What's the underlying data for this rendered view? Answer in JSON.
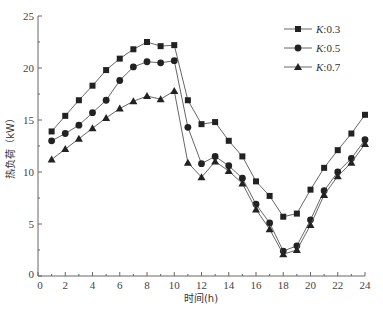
{
  "chart_data": {
    "type": "line",
    "title": "",
    "xlabel": "时间(h)",
    "ylabel": "热负荷（kW）",
    "xlim": [
      0,
      24
    ],
    "ylim": [
      0,
      25
    ],
    "xticks": [
      0,
      2,
      4,
      6,
      8,
      10,
      12,
      14,
      16,
      18,
      20,
      22,
      24
    ],
    "yticks": [
      0,
      5,
      10,
      15,
      20,
      25
    ],
    "grid": false,
    "legend_position": "upper right",
    "x": [
      1,
      2,
      3,
      4,
      5,
      6,
      7,
      8,
      9,
      10,
      11,
      12,
      13,
      14,
      15,
      16,
      17,
      18,
      19,
      20,
      21,
      22,
      23,
      24
    ],
    "series": [
      {
        "name": "K:0.3",
        "marker": "square",
        "values": [
          13.9,
          15.4,
          16.9,
          18.3,
          19.8,
          20.9,
          21.8,
          22.5,
          22.1,
          22.2,
          16.9,
          14.6,
          14.8,
          13.0,
          11.5,
          9.1,
          7.7,
          5.7,
          6.0,
          8.3,
          10.4,
          12.1,
          13.7,
          15.5
        ]
      },
      {
        "name": "K:0.5",
        "marker": "circle",
        "values": [
          13.0,
          13.7,
          14.5,
          15.7,
          16.9,
          18.8,
          20.1,
          20.6,
          20.5,
          20.7,
          14.3,
          10.8,
          11.5,
          10.6,
          9.4,
          6.9,
          5.1,
          2.4,
          2.9,
          5.4,
          8.2,
          10.0,
          11.3,
          13.1
        ]
      },
      {
        "name": "K:0.7",
        "marker": "triangle",
        "values": [
          11.2,
          12.2,
          13.2,
          14.2,
          15.2,
          16.1,
          16.8,
          17.3,
          17.0,
          17.8,
          10.9,
          9.5,
          11.0,
          10.1,
          8.9,
          6.4,
          4.5,
          2.1,
          2.5,
          4.9,
          7.8,
          9.6,
          10.9,
          12.7
        ]
      }
    ]
  },
  "legend": {
    "items": [
      {
        "prefix": "K",
        "suffix": ":0.3"
      },
      {
        "prefix": "K",
        "suffix": ":0.5"
      },
      {
        "prefix": "K",
        "suffix": ":0.7"
      }
    ]
  },
  "colors": {
    "line": "#555555",
    "marker": "#222222",
    "axis": "#666666"
  }
}
